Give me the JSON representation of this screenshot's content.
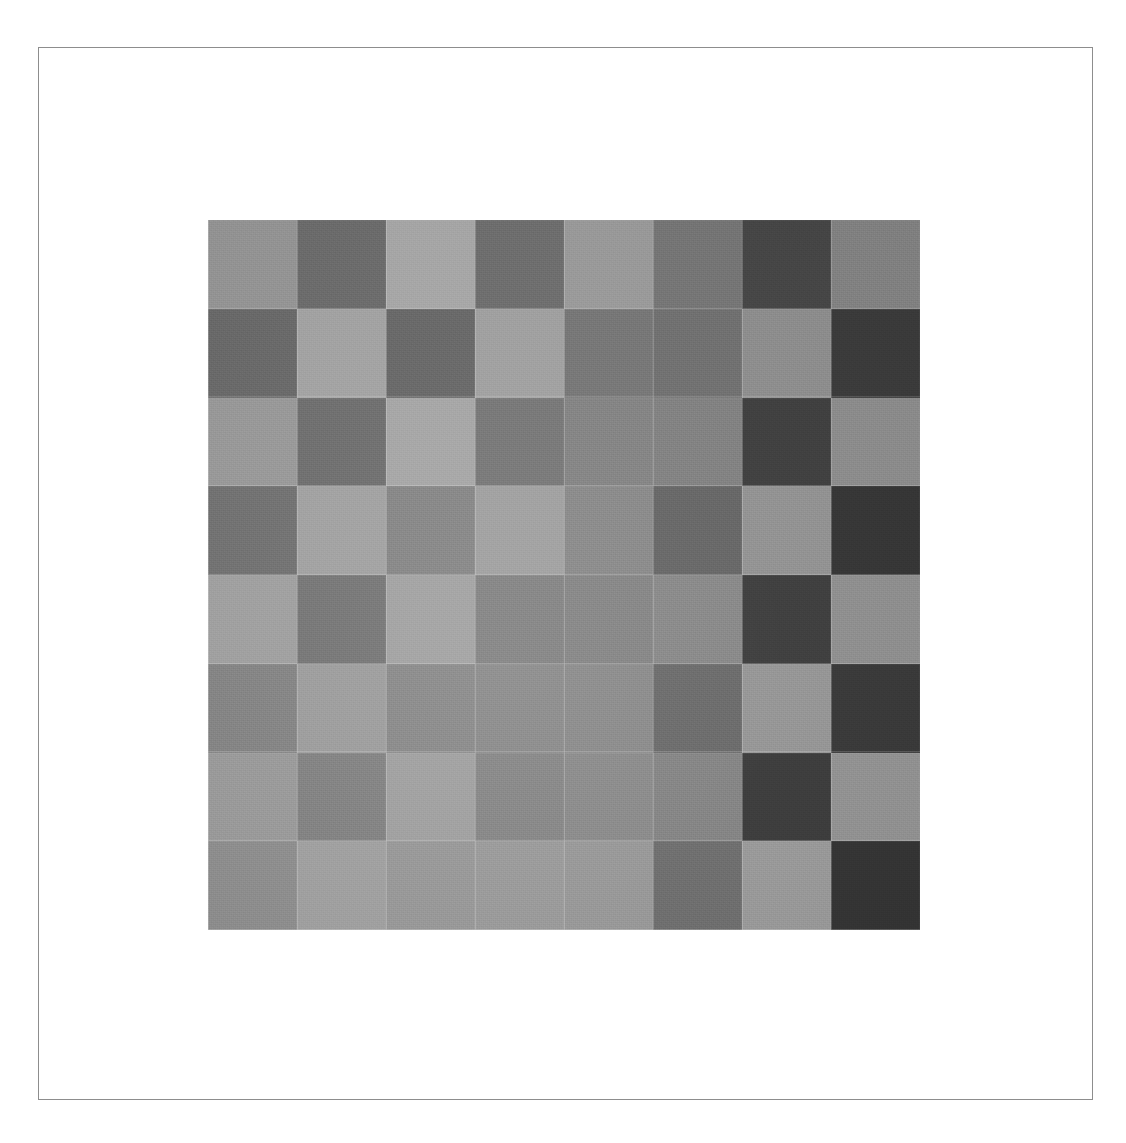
{
  "page": {
    "background_color": "#ffffff",
    "width": 1126,
    "height": 1143
  },
  "frame": {
    "name": "page-border",
    "border_color": "#8d8d8d",
    "border_width": 1,
    "left": 38,
    "top": 47,
    "width": 1055,
    "height": 1053
  },
  "chart_data": {
    "type": "heatmap",
    "title": "",
    "subtitle": "",
    "xlabel": "",
    "ylabel": "",
    "legend_position": "none",
    "grid": false,
    "rows": 8,
    "cols": 8,
    "x": [
      "c1",
      "c2",
      "c3",
      "c4",
      "c5",
      "c6",
      "c7",
      "c8"
    ],
    "categories": [
      "r1",
      "r2",
      "r3",
      "r4",
      "r5",
      "r6",
      "r7",
      "r8"
    ],
    "value_unit": "8-bit gray level",
    "value_range": [
      40,
      190
    ],
    "colormap": "grayscale",
    "values": [
      [
        150,
        108,
        168,
        110,
        155,
        118,
        70,
        132
      ],
      [
        105,
        163,
        104,
        160,
        118,
        112,
        142,
        58
      ],
      [
        152,
        110,
        165,
        118,
        130,
        128,
        62,
        140
      ],
      [
        112,
        160,
        132,
        158,
        135,
        100,
        145,
        52
      ],
      [
        158,
        116,
        160,
        128,
        130,
        134,
        60,
        142
      ],
      [
        130,
        155,
        135,
        136,
        136,
        104,
        148,
        55
      ],
      [
        152,
        128,
        158,
        132,
        136,
        130,
        58,
        145
      ],
      [
        140,
        158,
        150,
        152,
        150,
        108,
        152,
        50
      ]
    ],
    "row_labels": [
      "row-1",
      "row-2",
      "row-3",
      "row-4",
      "row-5",
      "row-6",
      "row-7",
      "row-8"
    ],
    "col_labels": [
      "col-1",
      "col-2",
      "col-3",
      "col-4",
      "col-5",
      "col-6",
      "col-7",
      "col-8"
    ],
    "hex_values": [
      [
        "#969696",
        "#6c6c6c",
        "#a8a8a8",
        "#6e6e6e",
        "#9b9b9b",
        "#767676",
        "#464646",
        "#848484"
      ],
      [
        "#696969",
        "#a3a3a3",
        "#686868",
        "#a0a0a0",
        "#767676",
        "#707070",
        "#8e8e8e",
        "#3a3a3a"
      ],
      [
        "#989898",
        "#6e6e6e",
        "#a5a5a5",
        "#767676",
        "#828282",
        "#808080",
        "#3e3e3e",
        "#8c8c8c"
      ],
      [
        "#707070",
        "#a0a0a0",
        "#848484",
        "#9e9e9e",
        "#878787",
        "#646464",
        "#919191",
        "#343434"
      ],
      [
        "#9e9e9e",
        "#747474",
        "#a0a0a0",
        "#808080",
        "#828282",
        "#868686",
        "#3c3c3c",
        "#8e8e8e"
      ],
      [
        "#828282",
        "#9b9b9b",
        "#878787",
        "#888888",
        "#888888",
        "#686868",
        "#949494",
        "#373737"
      ],
      [
        "#989898",
        "#808080",
        "#9e9e9e",
        "#848484",
        "#888888",
        "#828282",
        "#3a3a3a",
        "#919191"
      ],
      [
        "#8c8c8c",
        "#9e9e9e",
        "#969696",
        "#989898",
        "#969696",
        "#6c6c6c",
        "#989898",
        "#323232"
      ]
    ]
  },
  "board": {
    "name": "checkerboard-target",
    "left": 208,
    "top": 220,
    "width": 712,
    "height": 710,
    "cell_size": 89
  }
}
